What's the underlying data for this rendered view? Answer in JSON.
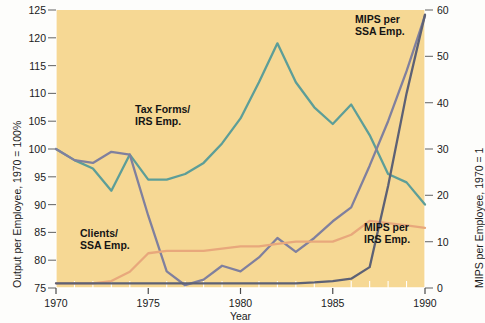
{
  "chart": {
    "type": "line",
    "title": "",
    "background_color": "#f6d894",
    "page_color": "#fdfdfb",
    "xlabel": "Year",
    "ylabel_left": "Output per Employee, 1970 = 100%",
    "ylabel_right": "MIPS per Employee, 1970 = 1",
    "xlim": [
      1970,
      1990
    ],
    "ylim_left": [
      75,
      125
    ],
    "ylim_right": [
      0,
      60
    ],
    "xticks": [
      1970,
      1975,
      1980,
      1985,
      1990
    ],
    "xtick_labels": [
      "1970",
      "1975",
      "1980",
      "1985",
      "1990"
    ],
    "xminor_step": 1,
    "yticks_left": [
      75,
      80,
      85,
      90,
      95,
      100,
      105,
      110,
      115,
      120,
      125
    ],
    "ytick_labels_left": [
      "75",
      "80",
      "85",
      "90",
      "95",
      "100",
      "105",
      "110",
      "115",
      "120",
      "125"
    ],
    "yticks_right": [
      0,
      10,
      20,
      30,
      40,
      50,
      60
    ],
    "ytick_labels_right": [
      "0",
      "10",
      "20",
      "30",
      "40",
      "50",
      "60"
    ],
    "grid": false,
    "legend_position": "inline-annotations"
  },
  "chart_data": {
    "type": "line",
    "title": "",
    "xlabel": "Year",
    "ylabel": "Output per Employee, 1970 = 100%",
    "ylabel_secondary": "MIPS per Employee, 1970 = 1",
    "xlim": [
      1970,
      1990
    ],
    "ylim": [
      75,
      125
    ],
    "ylim_secondary": [
      0,
      60
    ],
    "grid": false,
    "x": [
      1970,
      1971,
      1972,
      1973,
      1974,
      1975,
      1976,
      1977,
      1978,
      1979,
      1980,
      1981,
      1982,
      1983,
      1984,
      1985,
      1986,
      1987,
      1988,
      1989,
      1990
    ],
    "series": [
      {
        "name": "Tax Forms/ IRS Emp.",
        "axis": "left",
        "color": "#5d9e98",
        "values": [
          100,
          98,
          96.5,
          92.5,
          99,
          94.5,
          94.5,
          95.5,
          97.5,
          101,
          105.5,
          112,
          119,
          112,
          107.5,
          104.5,
          108,
          102.5,
          95.5,
          94,
          90
        ]
      },
      {
        "name": "Clients/ SSA Emp.",
        "axis": "left",
        "color": "#80809e",
        "values": [
          100,
          98,
          97.5,
          99.5,
          99,
          88,
          78,
          75.5,
          76.5,
          79,
          78,
          80.5,
          84,
          81.5,
          84,
          87,
          89.5,
          97,
          105,
          114,
          124
        ]
      },
      {
        "name": "MIPS per IRS Emp.",
        "axis": "right",
        "color": "#e8a87c",
        "values": [
          1,
          1,
          1,
          1.5,
          3.5,
          7.5,
          8,
          8,
          8,
          8.5,
          9,
          9,
          9.5,
          10,
          10,
          10,
          11.5,
          14.5,
          14,
          13.5,
          13
        ]
      },
      {
        "name": "MIPS per SSA Emp.",
        "axis": "right",
        "color": "#5d6175",
        "values": [
          1,
          1,
          1,
          1,
          1,
          1,
          1,
          1,
          1,
          1,
          1,
          1,
          1,
          1,
          1.2,
          1.5,
          2,
          4.5,
          22,
          42,
          59
        ]
      }
    ],
    "annotations": [
      {
        "text": "Tax Forms/\nIRS Emp.",
        "x": 1977.0,
        "y_left": 107.5
      },
      {
        "text": "Clients/\nSSA Emp.",
        "x": 1973.2,
        "y_left": 84.0
      },
      {
        "text": "MIPS per\nSSA Emp.",
        "x": 1986.8,
        "y_right": 56.5
      },
      {
        "text": "MIPS per\nIRS Emp.",
        "x": 1987.0,
        "y_right": 12.5
      }
    ]
  }
}
